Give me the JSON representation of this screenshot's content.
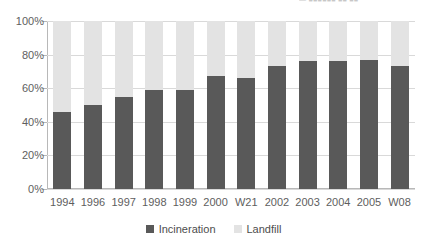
{
  "top_fragment": {
    "text": "— ■■■■■■ ■■ ■■"
  },
  "colors": {
    "incineration": "#595959",
    "landfill": "#e3e3e3",
    "gridline": "#d9d9d9",
    "axis": "#b8b8b8",
    "text": "#5e5e5e",
    "background": "#ffffff"
  },
  "legend": {
    "position": "bottom-center",
    "items": [
      {
        "label": "Incineration",
        "color": "#595959"
      },
      {
        "label": "Landfill",
        "color": "#e3e3e3"
      }
    ]
  },
  "yaxis": {
    "ticks": [
      "100%",
      "80%",
      "60%",
      "40%",
      "20%",
      "0%"
    ],
    "tick_values": [
      100,
      80,
      60,
      40,
      20,
      0
    ],
    "min": 0,
    "max": 100
  },
  "chart_data": {
    "type": "bar",
    "title": "",
    "subtitle": "",
    "xlabel": "",
    "ylabel": "",
    "ylim": [
      0,
      100
    ],
    "grid": true,
    "stacked": true,
    "stacked_to_100": true,
    "legend_position": "bottom",
    "categories": [
      "1994",
      "1996",
      "1997",
      "1998",
      "1999",
      "2000",
      "W21",
      "2002",
      "2003",
      "2004",
      "2005",
      "W08"
    ],
    "ytick_labels": [
      "0%",
      "20%",
      "40%",
      "60%",
      "80%",
      "100%"
    ],
    "series": [
      {
        "name": "Incineration",
        "color": "#595959",
        "values": [
          46,
          50,
          55,
          59,
          59,
          67,
          66,
          73,
          76,
          76,
          77,
          73
        ]
      },
      {
        "name": "Landfill",
        "color": "#e3e3e3",
        "values": [
          54,
          50,
          45,
          41,
          41,
          33,
          34,
          27,
          24,
          24,
          23,
          27
        ]
      }
    ],
    "annotations": []
  }
}
